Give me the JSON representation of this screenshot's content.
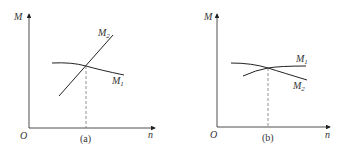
{
  "panels": [
    {
      "id": "a",
      "caption": "(a)",
      "y_axis_label": "M",
      "x_axis_label": "n",
      "origin_label": "O",
      "curves": [
        {
          "name": "M",
          "sub": "1",
          "description": "slightly decreasing curve"
        },
        {
          "name": "M",
          "sub": "2",
          "description": "steeply increasing line"
        }
      ]
    },
    {
      "id": "b",
      "caption": "(b)",
      "y_axis_label": "M",
      "x_axis_label": "n",
      "origin_label": "O",
      "curves": [
        {
          "name": "M",
          "sub": "1",
          "description": "slightly increasing curve"
        },
        {
          "name": "M",
          "sub": "2",
          "description": "decreasing curve"
        }
      ]
    }
  ],
  "colors": {
    "line": "#222222",
    "dashed": "#666666",
    "text": "#333333"
  }
}
